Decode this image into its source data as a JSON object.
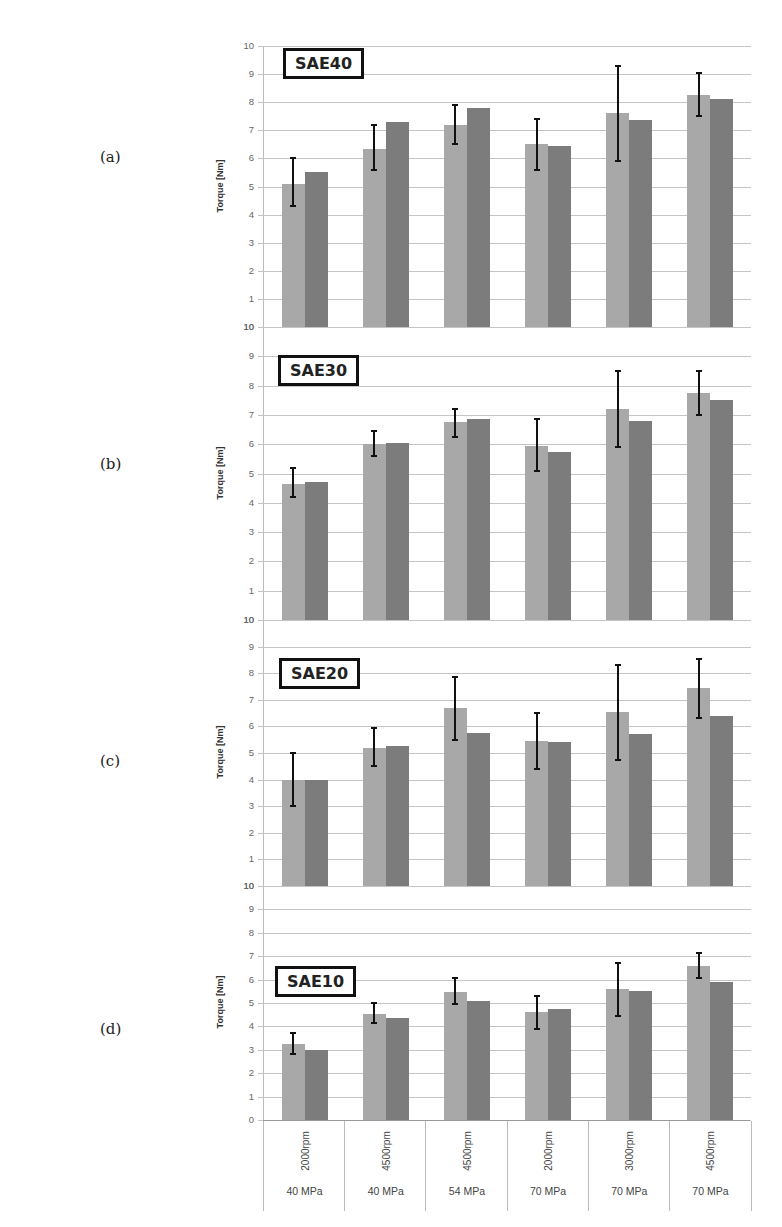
{
  "figure": {
    "panel_letters": [
      "(a)",
      "(b)",
      "(c)",
      "(d)"
    ],
    "y_axis_title": "Torque [Nm]",
    "categories": [
      {
        "rpm": "2000rpm",
        "pressure": "40 MPa"
      },
      {
        "rpm": "4500rpm",
        "pressure": "40 MPa"
      },
      {
        "rpm": "4500rpm",
        "pressure": "54 MPa"
      },
      {
        "rpm": "2000rpm",
        "pressure": "70 MPa"
      },
      {
        "rpm": "3000rpm",
        "pressure": "70 MPa"
      },
      {
        "rpm": "4500rpm",
        "pressure": "70 MPa"
      }
    ],
    "colors": {
      "series1": "#a8a8a8",
      "series2": "#7c7c7c",
      "error_bar": "#111111",
      "grid": "#c4c4c4"
    }
  },
  "chart_data": [
    {
      "type": "bar",
      "title": "SAE40",
      "panel": "(a)",
      "categories": [
        "2000rpm 40 MPa",
        "4500rpm 40 MPa",
        "4500rpm 54 MPa",
        "2000rpm 70 MPa",
        "3000rpm 70 MPa",
        "4500rpm 70 MPa"
      ],
      "series": [
        {
          "name": "series 1 (light, with error bars)",
          "values": [
            5.1,
            6.35,
            7.2,
            6.5,
            7.6,
            8.25
          ],
          "error_low": [
            4.3,
            5.6,
            6.5,
            5.6,
            5.9,
            7.5
          ],
          "error_high": [
            6.0,
            7.2,
            7.9,
            7.4,
            9.3,
            9.05
          ]
        },
        {
          "name": "series 2 (dark)",
          "values": [
            5.5,
            7.3,
            7.8,
            6.45,
            7.35,
            8.1
          ]
        }
      ],
      "ylabel": "Torque [Nm]",
      "yticks": [
        "10",
        "1",
        "2",
        "3",
        "4",
        "5",
        "6",
        "7",
        "8",
        "9",
        "10"
      ],
      "ylim": [
        0,
        10
      ],
      "grid": true
    },
    {
      "type": "bar",
      "title": "SAE30",
      "panel": "(b)",
      "categories": [
        "2000rpm 40 MPa",
        "4500rpm 40 MPa",
        "4500rpm 54 MPa",
        "2000rpm 70 MPa",
        "3000rpm 70 MPa",
        "4500rpm 70 MPa"
      ],
      "series": [
        {
          "name": "series 1 (light, with error bars)",
          "values": [
            4.65,
            6.0,
            6.75,
            5.95,
            7.2,
            7.75
          ],
          "error_low": [
            4.2,
            5.6,
            6.25,
            5.1,
            5.9,
            7.0
          ],
          "error_high": [
            5.2,
            6.45,
            7.2,
            6.85,
            8.5,
            8.5
          ]
        },
        {
          "name": "series 2 (dark)",
          "values": [
            4.7,
            6.05,
            6.85,
            5.75,
            6.8,
            7.5
          ]
        }
      ],
      "ylabel": "Torque [Nm]",
      "yticks": [
        "10",
        "1",
        "2",
        "3",
        "4",
        "5",
        "6",
        "7",
        "8",
        "9",
        "10"
      ],
      "ylim": [
        0,
        10
      ],
      "grid": true
    },
    {
      "type": "bar",
      "title": "SAE20",
      "panel": "(c)",
      "categories": [
        "2000rpm 40 MPa",
        "4500rpm 40 MPa",
        "4500rpm 54 MPa",
        "2000rpm 70 MPa",
        "3000rpm 70 MPa",
        "4500rpm 70 MPa"
      ],
      "series": [
        {
          "name": "series 1 (light, with error bars)",
          "values": [
            4.0,
            5.2,
            6.7,
            5.45,
            6.55,
            7.45
          ],
          "error_low": [
            3.0,
            4.5,
            5.5,
            4.4,
            4.75,
            6.3
          ],
          "error_high": [
            5.0,
            5.95,
            7.85,
            6.5,
            8.3,
            8.55
          ]
        },
        {
          "name": "series 2 (dark)",
          "values": [
            4.0,
            5.25,
            5.75,
            5.4,
            5.7,
            6.4
          ]
        }
      ],
      "ylabel": "Torque [Nm]",
      "yticks": [
        "10",
        "1",
        "2",
        "3",
        "4",
        "5",
        "6",
        "7",
        "8",
        "9",
        "10"
      ],
      "ylim": [
        0,
        10
      ],
      "grid": true
    },
    {
      "type": "bar",
      "title": "SAE10",
      "panel": "(d)",
      "categories": [
        "2000rpm 40 MPa",
        "4500rpm 40 MPa",
        "4500rpm 54 MPa",
        "2000rpm 70 MPa",
        "3000rpm 70 MPa",
        "4500rpm 70 MPa"
      ],
      "series": [
        {
          "name": "series 1 (light, with error bars)",
          "values": [
            3.25,
            4.55,
            5.45,
            4.6,
            5.6,
            6.6
          ],
          "error_low": [
            2.8,
            4.15,
            4.95,
            3.9,
            4.45,
            6.05
          ],
          "error_high": [
            3.7,
            5.0,
            6.05,
            5.3,
            6.7,
            7.15
          ]
        },
        {
          "name": "series 2 (dark)",
          "values": [
            3.0,
            4.35,
            5.1,
            4.75,
            5.5,
            5.9
          ]
        }
      ],
      "ylabel": "Torque [Nm]",
      "yticks": [
        "0",
        "1",
        "2",
        "3",
        "4",
        "5",
        "6",
        "7",
        "8",
        "9",
        "10"
      ],
      "ylim": [
        0,
        10
      ],
      "grid": true
    }
  ]
}
